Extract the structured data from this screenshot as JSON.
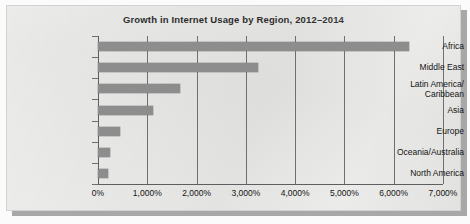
{
  "figure": {
    "panel_bg": "#e6e6e4",
    "bar_color": "#8d8d8d",
    "axis_color": "#5e5e5e"
  },
  "chart_data": {
    "type": "bar",
    "orientation": "horizontal",
    "title": "Growth in Internet Usage by Region, 2012–2014",
    "xlabel": "",
    "ylabel": "",
    "xlim": [
      0,
      7000
    ],
    "grid": true,
    "legend": "none",
    "categories": [
      "Africa",
      "Middle East",
      "Latin America/\nCaribbean",
      "Asia",
      "Europe",
      "Oceania/Australia",
      "North America"
    ],
    "category_labels": [
      {
        "line1": "Africa",
        "line2": ""
      },
      {
        "line1": "Middle East",
        "line2": ""
      },
      {
        "line1": "Latin America/",
        "line2": "Caribbean"
      },
      {
        "line1": "Asia",
        "line2": ""
      },
      {
        "line1": "Europe",
        "line2": ""
      },
      {
        "line1": "Oceania/Australia",
        "line2": ""
      },
      {
        "line1": "North America",
        "line2": ""
      }
    ],
    "values": [
      6300,
      3245,
      1665,
      1115,
      445,
      250,
      200
    ],
    "xticks": [
      0,
      1000,
      2000,
      3000,
      4000,
      5000,
      6000,
      7000
    ],
    "xticklabels": [
      "0%",
      "1,000%",
      "2,000%",
      "3,000%",
      "4,000%",
      "5,000%",
      "6,000%",
      "7,000%"
    ]
  }
}
